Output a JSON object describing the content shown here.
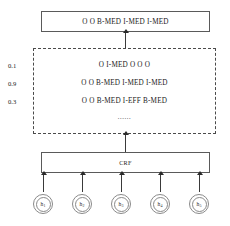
{
  "figure": {
    "output": {
      "sequence": "O  O  B-MED  I-MED  I-MED",
      "tokens": [
        "O",
        "O",
        "B-MED",
        "I-MED",
        "I-MED"
      ]
    },
    "candidates": {
      "ellipsis": "......",
      "rows": [
        {
          "score": "0.1",
          "sequence": "O  I-MED  O  O  O",
          "tokens": [
            "O",
            "I-MED",
            "O",
            "O",
            "O"
          ]
        },
        {
          "score": "0.9",
          "sequence": "O  O  B-MED  I-MED  I-MED",
          "tokens": [
            "O",
            "O",
            "B-MED",
            "I-MED",
            "I-MED"
          ]
        },
        {
          "score": "0.3",
          "sequence": "O  O  B-MED  I-EFF  B-MED",
          "tokens": [
            "O",
            "O",
            "B-MED",
            "I-EFF",
            "B-MED"
          ]
        }
      ]
    },
    "crf": {
      "label": "CRF"
    },
    "hidden_states": [
      {
        "label": "h",
        "index": "1"
      },
      {
        "label": "h",
        "index": "2"
      },
      {
        "label": "h",
        "index": "3"
      },
      {
        "label": "h",
        "index": "4"
      },
      {
        "label": "h",
        "index": "5"
      }
    ],
    "colors": {
      "box_border": "#5a5a5a",
      "dashed_border": "#4a4a4a",
      "arrow": "#2a2a2a",
      "node_border": "#8a8a8a",
      "text": "#1a1a1a",
      "background": "#ffffff"
    }
  }
}
